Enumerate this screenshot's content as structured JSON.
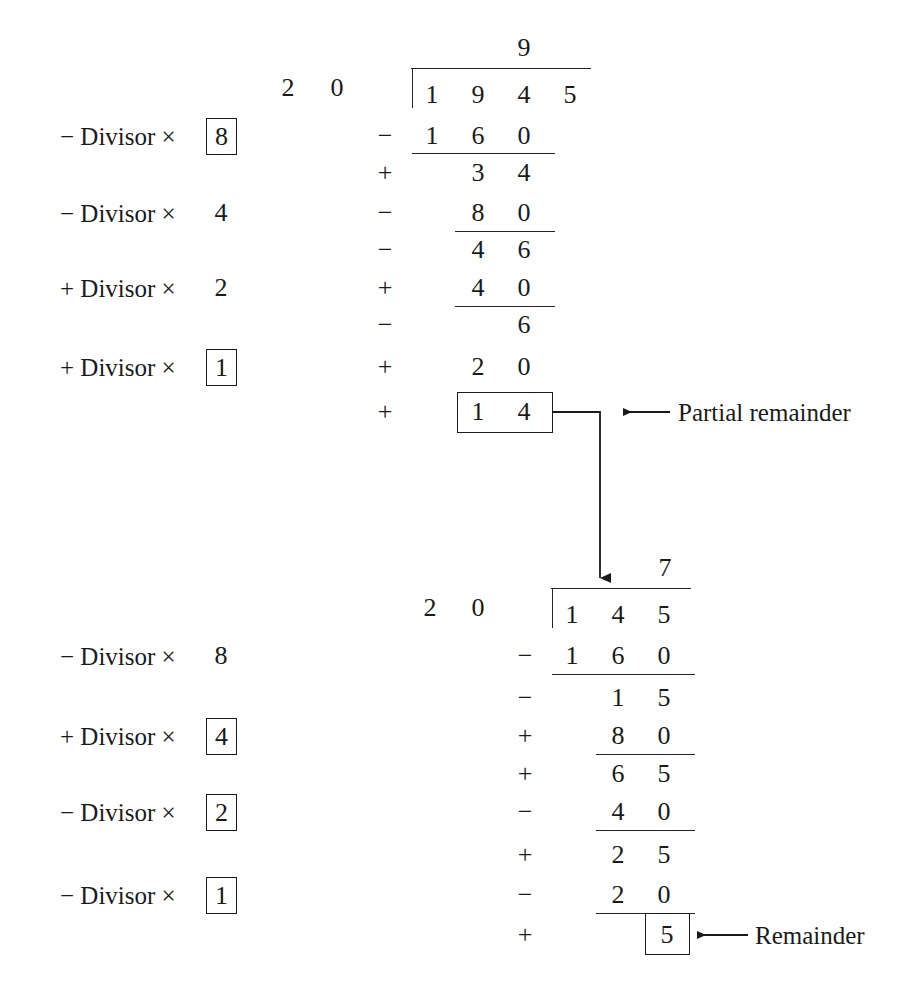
{
  "figure": {
    "type": "non-restoring-division-worked-example",
    "background_color": "#ffffff",
    "ink_color": "#1a1a1a"
  },
  "block_top": {
    "divisor_digits": [
      "2",
      "0"
    ],
    "quotient_digit": "9",
    "dividend_digits": [
      "1",
      "9",
      "4",
      "5"
    ],
    "rows": [
      {
        "sign": "−",
        "digits": [
          "1",
          "6",
          "0"
        ],
        "underline": true
      },
      {
        "sign": "+",
        "digits": [
          "",
          "3",
          "4"
        ],
        "underline": false
      },
      {
        "sign": "−",
        "digits": [
          "",
          "8",
          "0"
        ],
        "underline": true
      },
      {
        "sign": "−",
        "digits": [
          "",
          "4",
          "6"
        ],
        "underline": false
      },
      {
        "sign": "+",
        "digits": [
          "",
          "4",
          "0"
        ],
        "underline": true
      },
      {
        "sign": "−",
        "digits": [
          "",
          "",
          "6"
        ],
        "underline": false
      },
      {
        "sign": "+",
        "digits": [
          "",
          "2",
          "0"
        ],
        "underline": false
      },
      {
        "sign": "+",
        "digits": [
          "",
          "1",
          "4"
        ],
        "underline": false,
        "boxed": true
      }
    ],
    "labels": [
      {
        "sign": "−",
        "text": "Divisor ×",
        "multiplier": "8",
        "boxed": true
      },
      {
        "sign": "−",
        "text": "Divisor ×",
        "multiplier": "4",
        "boxed": false
      },
      {
        "sign": "+",
        "text": "Divisor ×",
        "multiplier": "2",
        "boxed": false
      },
      {
        "sign": "+",
        "text": "Divisor ×",
        "multiplier": "1",
        "boxed": true
      }
    ]
  },
  "block_bottom": {
    "divisor_digits": [
      "2",
      "0"
    ],
    "quotient_digit": "7",
    "dividend_digits": [
      "1",
      "4",
      "5"
    ],
    "rows": [
      {
        "sign": "−",
        "digits": [
          "1",
          "6",
          "0"
        ],
        "underline": true
      },
      {
        "sign": "−",
        "digits": [
          "",
          "1",
          "5"
        ],
        "underline": false
      },
      {
        "sign": "+",
        "digits": [
          "",
          "8",
          "0"
        ],
        "underline": true
      },
      {
        "sign": "+",
        "digits": [
          "",
          "6",
          "5"
        ],
        "underline": false
      },
      {
        "sign": "−",
        "digits": [
          "",
          "4",
          "0"
        ],
        "underline": true
      },
      {
        "sign": "+",
        "digits": [
          "",
          "2",
          "5"
        ],
        "underline": false
      },
      {
        "sign": "−",
        "digits": [
          "",
          "2",
          "0"
        ],
        "underline": true
      },
      {
        "sign": "+",
        "digits": [
          "",
          "",
          "5"
        ],
        "underline": false,
        "boxed": true
      }
    ],
    "labels": [
      {
        "sign": "−",
        "text": "Divisor ×",
        "multiplier": "8",
        "boxed": false
      },
      {
        "sign": "+",
        "text": "Divisor ×",
        "multiplier": "4",
        "boxed": true
      },
      {
        "sign": "−",
        "text": "Divisor ×",
        "multiplier": "2",
        "boxed": true
      },
      {
        "sign": "−",
        "text": "Divisor ×",
        "multiplier": "1",
        "boxed": true
      }
    ]
  },
  "annotations": {
    "partial_remainder": "Partial remainder",
    "remainder": "Remainder"
  }
}
